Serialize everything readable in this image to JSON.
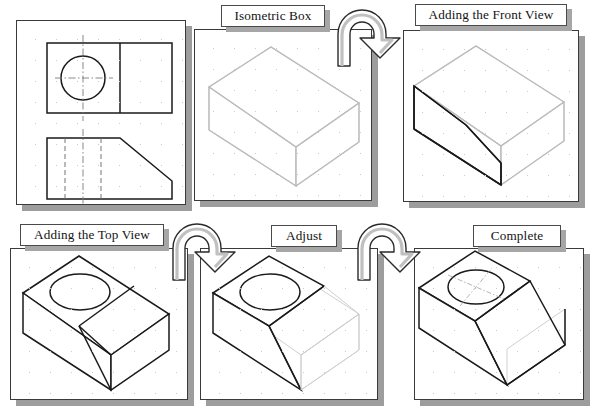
{
  "figure": {
    "title_semantics": "isometric-construction-tutorial",
    "panel_count": 6
  },
  "steps": [
    {
      "id": "step-1",
      "label": "",
      "drawing": "orthographic-views",
      "description": "Two-view orthographic drawing: top view with circle and centerlines, front view with chamfer and hidden lines"
    },
    {
      "id": "step-2",
      "label": "Isometric Box",
      "drawing": "isometric-box",
      "description": "Light construction box in isometric projection"
    },
    {
      "id": "step-3",
      "label": "Adding the Front View",
      "drawing": "front-view-added",
      "description": "Front profile with chamfer drawn on the left face of the construction box"
    },
    {
      "id": "step-4",
      "label": "Adding the Top View",
      "drawing": "top-view-added",
      "description": "Top face outline with circular hole ellipse added"
    },
    {
      "id": "step-5",
      "label": "Adjust",
      "drawing": "adjusted",
      "description": "Construction lines trimmed, sloped face formed"
    },
    {
      "id": "step-6",
      "label": "Complete",
      "drawing": "complete",
      "description": "Finished isometric solid with hole centerlines"
    }
  ],
  "arrows": [
    {
      "id": "arrow-1",
      "from": "step-2",
      "to": "step-3",
      "shape": "u-turn-arrow"
    },
    {
      "id": "arrow-2",
      "from": "step-4",
      "to": "step-5",
      "shape": "u-turn-arrow"
    },
    {
      "id": "arrow-3",
      "from": "step-5",
      "to": "step-6",
      "shape": "u-turn-arrow"
    }
  ],
  "colors": {
    "page_background": "#ffffff",
    "panel_border": "#3a3a3a",
    "panel_shadow": "#9d9d9d",
    "line_dark": "#1a1a1a",
    "line_construction": "#bdbdbd",
    "grid_dot": "#c9c9c9",
    "label_text": "#131313"
  }
}
